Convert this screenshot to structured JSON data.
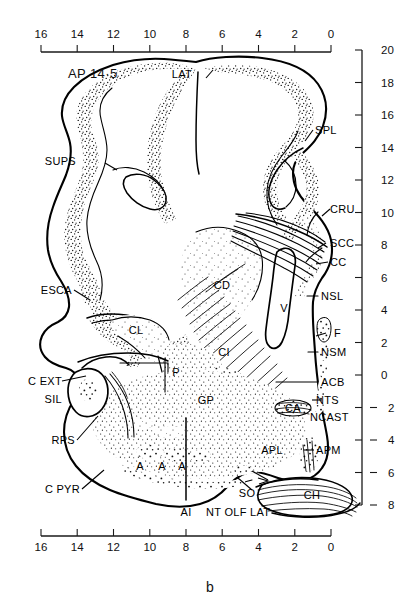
{
  "figure": {
    "label": "b",
    "section_note": "AP 14·5"
  },
  "axes": {
    "top": {
      "ticks": [
        "16",
        "14",
        "12",
        "10",
        "8",
        "6",
        "4",
        "2",
        "0"
      ]
    },
    "bottom": {
      "ticks": [
        "16",
        "14",
        "12",
        "10",
        "8",
        "6",
        "4",
        "2",
        "0"
      ]
    },
    "right": {
      "ticks": [
        "20",
        "18",
        "16",
        "14",
        "12",
        "10",
        "8",
        "6",
        "4",
        "2",
        "0",
        "2",
        "4",
        "6",
        "8"
      ]
    }
  },
  "labels": {
    "left": [
      {
        "key": "sups",
        "text": "SUPS"
      },
      {
        "key": "esca",
        "text": "ESCA"
      },
      {
        "key": "cext",
        "text": "C EXT"
      },
      {
        "key": "sil",
        "text": "SIL"
      },
      {
        "key": "rps",
        "text": "RPS"
      },
      {
        "key": "cpyr",
        "text": "C PYR"
      }
    ],
    "top": [
      {
        "key": "lat",
        "text": "LAT"
      },
      {
        "key": "spl",
        "text": "SPL"
      }
    ],
    "right": [
      {
        "key": "cru",
        "text": "CRU"
      },
      {
        "key": "scc",
        "text": "SCC"
      },
      {
        "key": "cc",
        "text": "CC"
      },
      {
        "key": "nsl",
        "text": "NSL"
      },
      {
        "key": "f",
        "text": "F"
      },
      {
        "key": "nsm",
        "text": "NSM"
      },
      {
        "key": "acb",
        "text": "ACB"
      },
      {
        "key": "nts",
        "text": "NTS"
      },
      {
        "key": "ncast",
        "text": "NCAST"
      },
      {
        "key": "apm",
        "text": "APM"
      }
    ],
    "interior": [
      {
        "key": "cd",
        "text": "CD"
      },
      {
        "key": "cl",
        "text": "CL"
      },
      {
        "key": "ci",
        "text": "CI"
      },
      {
        "key": "p",
        "text": "P"
      },
      {
        "key": "gp",
        "text": "GP"
      },
      {
        "key": "v",
        "text": "V"
      },
      {
        "key": "ca",
        "text": "CA"
      },
      {
        "key": "apl",
        "text": "APL"
      },
      {
        "key": "ch",
        "text": "CH"
      },
      {
        "key": "so",
        "text": "SO"
      },
      {
        "key": "a1",
        "text": "A"
      },
      {
        "key": "a2",
        "text": "A"
      },
      {
        "key": "a3",
        "text": "A"
      }
    ],
    "bottom": [
      {
        "key": "ai",
        "text": "AI"
      },
      {
        "key": "ntolflat",
        "text": "NT OLF LAT"
      }
    ]
  },
  "colors": {
    "ink": "#000000",
    "paper": "#ffffff",
    "axis": "#1a1a1a"
  }
}
